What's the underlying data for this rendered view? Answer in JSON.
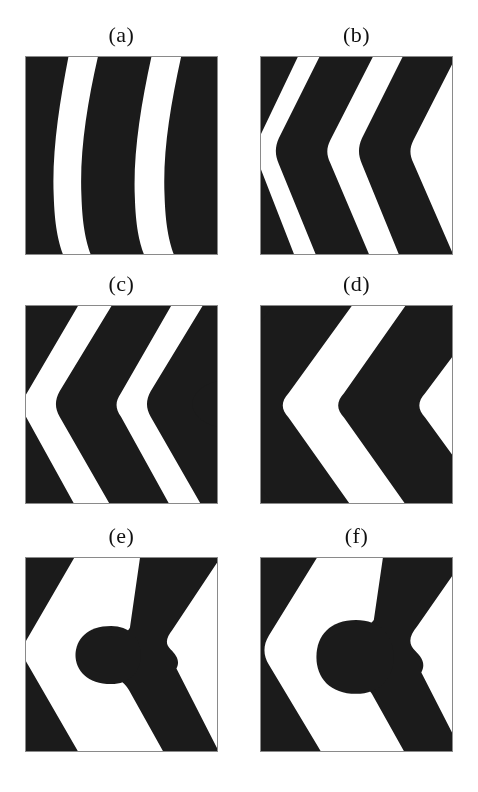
{
  "figure": {
    "background_color": "#ffffff",
    "domain_color": "#1b1b1b",
    "matrix_color": "#ffffff",
    "frame_color": "#8a8a8a",
    "label_color": "#111111",
    "rows": 3,
    "columns": 2,
    "panel_width": 193,
    "panel_height": 199
  },
  "panels": [
    {
      "id": "a",
      "label": "(a)",
      "x": 25,
      "y": 56,
      "width": 193,
      "height": 199,
      "label_y": 24,
      "description": "gently curved near-vertical lamellae, slight rightward bow",
      "stripe_count": 3,
      "paths": [
        "M -6,-6 L 44,-6 C 34,45 26,95 28,140 C 29,175 34,192 40,206 L -6,206 Z",
        "M 74,-6 L 128,-6 C 116,48 108,98 110,142 C 111,176 116,193 122,206 L 68,206 C 62,192 57,175 56,140 C 54,95 62,45 74,-6 Z",
        "M 158,-6 L 212,-6 C 200,48 192,98 194,142 C 195,176 200,193 206,206 L 152,206 C 146,192 141,175 140,140 C 138,95 146,48 158,-6 Z"
      ]
    },
    {
      "id": "b",
      "label": "(b)",
      "x": 260,
      "y": 56,
      "width": 193,
      "height": 199,
      "label_y": 24,
      "description": "chevron lamellae, apex pointing left at mid height, rounded vertices",
      "stripe_count": 3,
      "paths": [
        "M -6,-6 L 40,-6 L -2,82 C -6,90 -7,98 -3,106 L 36,206 L -6,206 Z",
        "M 62,-6 L 116,-6 L 70,84 C 66,92 66,99 70,107 L 112,206 L 58,206 L 18,108 C 14,99 14,91 18,82 Z",
        "M 146,-6 L 200,-6 L 154,84 C 150,92 150,99 154,107 L 197,206 L 142,206 L 102,108 C 98,99 98,91 102,82 Z"
      ]
    },
    {
      "id": "c",
      "label": "(c)",
      "x": 25,
      "y": 305,
      "width": 193,
      "height": 199,
      "label_y": 24,
      "description": "sharper chevrons with rounded left vertices plus an isolated rounded lobe entering the right edge",
      "stripe_count": 3,
      "paths": [
        "M -6,-6 L 56,-6 L 2,86 C -4,95 -5,103 0,112 L 52,206 L -6,206 Z",
        "M 90,-6 L 150,-6 L 96,88 C 90,97 90,103 96,112 L 148,206 L 88,206 L 34,112 C 29,103 29,95 34,86 Z",
        "M 182,-6 L 240,-6 L 188,88 C 182,97 182,103 188,112 L 238,206 L 180,206 L 126,112 C 121,103 121,95 126,86 Z",
        "M 205,74 C 180,76 168,88 168,99 C 168,110 180,122 205,124 L 205,74 Z"
      ]
    },
    {
      "id": "d",
      "label": "(d)",
      "x": 260,
      "y": 305,
      "width": 193,
      "height": 199,
      "label_y": 24,
      "description": "thick chevrons, rounded left vertices, small dark triangles clipped at upper-left and lower-left corners",
      "stripe_count": 2,
      "paths": [
        "M 14,-6 L 96,-6 L 28,88 C 20,97 20,104 28,113 L 94,206 L 12,206 L -54,113 C -62,104 -62,97 -54,88 Z",
        "M 150,-6 L 236,-6 L 166,88 C 158,97 158,104 166,113 L 234,206 L 150,206 L 84,113 C 76,104 76,97 84,88 Z",
        "M -6,-6 L 16,-6 L -6,24 Z",
        "M -6,206 L -6,176 L 16,206 Z"
      ]
    },
    {
      "id": "e",
      "label": "(e)",
      "x": 25,
      "y": 557,
      "width": 193,
      "height": 195,
      "label_y": 24,
      "description": "two chevrons merged into a branched network; a bulbous rounded lobe grows leftward from the central junction",
      "stripe_count": 2,
      "paths": [
        "M -6,-6 L 52,-6 L 2,82 C -4,91 -4,101 2,110 L 54,202 L -4,202 L -58,110 C -64,101 -64,91 -58,82 Z",
        "M 116,-6 L 200,-6 L 148,74 C 142,82 140,88 146,94 C 152,100 156,106 152,114 L 196,202 L 140,202 L 104,136 C 99,127 92,124 84,124 C 70,124 62,116 62,104 C 62,92 70,84 84,84 C 94,84 100,80 105,72 Z",
        "M 86,70 C 62,70 50,84 50,100 C 50,116 62,130 86,130 C 104,130 116,118 116,100 C 116,82 104,70 86,70 Z"
      ]
    },
    {
      "id": "f",
      "label": "(f)",
      "x": 260,
      "y": 557,
      "width": 193,
      "height": 195,
      "label_y": 24,
      "description": "like (e) but the bulbous lobe is larger and shifted right, joined to the right-hand chevron",
      "stripe_count": 2,
      "paths": [
        "M -6,-6 L 60,-6 L 8,80 C 2,90 2,100 8,110 L 62,202 L 2,202 L -54,110 C -60,100 -60,90 -54,80 Z",
        "M 124,-6 L 210,-6 L 158,70 C 150,80 148,88 156,96 C 164,104 166,110 162,118 L 204,202 L 146,202 L 112,140 C 106,130 98,126 88,126 C 72,126 62,116 62,102 C 62,88 72,78 88,78 C 100,78 108,72 114,64 Z",
        "M 96,64 C 70,64 56,80 56,102 C 56,124 70,140 96,140 C 120,140 134,124 134,102 C 134,80 120,64 96,64 Z"
      ]
    }
  ]
}
